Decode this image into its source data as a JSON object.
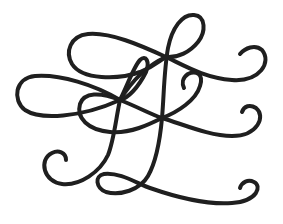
{
  "image": {
    "description": "Decorative calligraphic flourish ornament",
    "width": 283,
    "height": 224,
    "background": "#ffffff"
  },
  "flourish": {
    "stroke_color": "#1f1f1f",
    "stroke_width": 4,
    "strokes": [
      {
        "name": "upper-left-loop-swash",
        "d": "M 166 57 C 140 45, 110 32, 88 34 C 70 36, 65 52, 72 64 C 82 80, 118 80, 140 72 C 155 66, 160 60, 166 57 C 185 66, 205 78, 232 80 C 260 82, 272 62, 262 50 C 255 44, 245 48, 240 54"
      },
      {
        "name": "top-tall-loop",
        "d": "M 162 118 C 164 95, 164 70, 168 48 C 172 28, 182 14, 194 15 C 206 16, 206 32, 198 42 C 190 52, 178 58, 166 57 C 150 64, 135 76, 120 100"
      },
      {
        "name": "middle-left-loop-swash",
        "d": "M 120 100 C 95 85, 60 74, 35 76 C 15 78, 12 100, 25 110 C 40 120, 80 118, 120 100 C 140 108, 150 114, 162 118 C 185 125, 210 136, 232 136 C 258 136, 266 116, 256 108 C 250 104, 244 106, 242 112"
      },
      {
        "name": "small-inner-loop",
        "d": "M 120 100 C 128 84, 134 66, 140 60 C 146 54, 150 62, 146 72 C 138 88, 128 98, 120 100 C 116 118, 114 140, 108 155 C 100 172, 80 186, 62 184 C 44 182, 38 160, 52 153 C 58 150, 66 152, 66 160"
      },
      {
        "name": "center-left-lower-loop",
        "d": "M 120 100 C 100 92, 84 92, 80 104 C 76 118, 88 130, 110 132 C 130 134, 150 124, 162 118"
      },
      {
        "name": "right-small-curl",
        "d": "M 162 118 C 178 112, 196 100, 200 86 C 204 74, 196 70, 188 74 C 182 78, 182 84, 184 88"
      },
      {
        "name": "descender-and-bottom-swash",
        "d": "M 162 118 C 160 140, 156 162, 148 176 C 140 190, 120 196, 106 192 C 96 188, 94 176, 104 174 C 120 172, 138 184, 150 188 C 170 195, 205 205, 232 203 C 258 201, 262 186, 254 182 C 248 179, 242 182, 240 188"
      }
    ]
  }
}
